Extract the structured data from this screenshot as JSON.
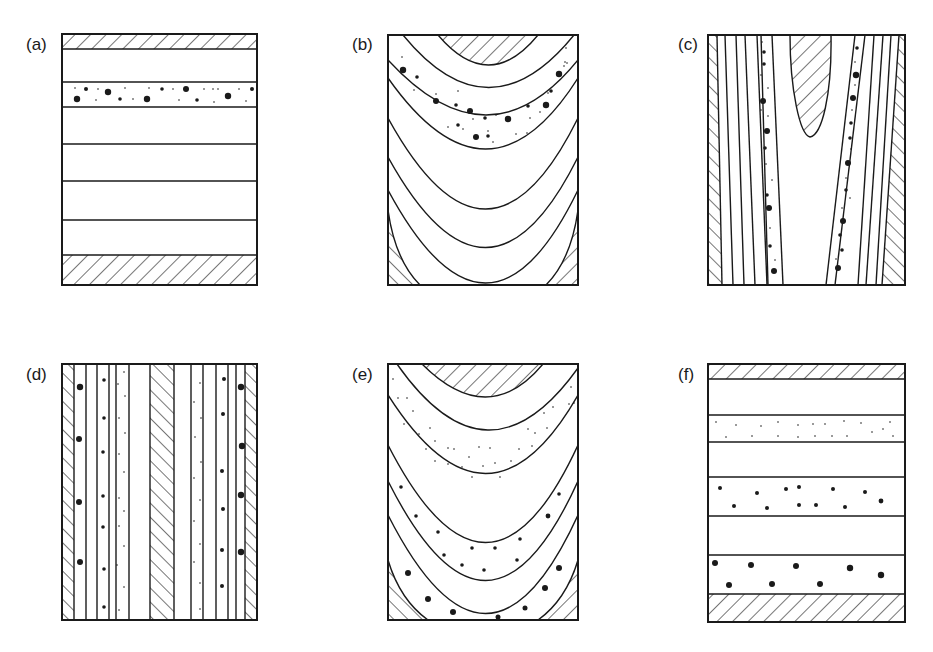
{
  "figure": {
    "ink_color": "#1a1a1a",
    "background_color": "#ffffff",
    "panels": [
      {
        "id": "a",
        "label": "(a)",
        "geometry": "horizontal layers",
        "hatched_units": [
          "top band",
          "bottom band"
        ],
        "layer_count": 6,
        "dotted_layers": [
          "second layer: mixed large and small dots"
        ]
      },
      {
        "id": "b",
        "label": "(b)",
        "geometry": "concave-up curved layers (synform)",
        "hatched_units": [
          "top center lens",
          "bottom-left corner",
          "bottom-right corner"
        ],
        "dotted_layers": [
          "upper curved band: mixed large and small dots"
        ]
      },
      {
        "id": "c",
        "label": "(c)",
        "geometry": "steep sub-vertical layers",
        "hatched_units": [
          "left edge strip",
          "right edge strip",
          "central top lens"
        ],
        "dotted_layers": [
          "left dotted strip",
          "right dotted strip"
        ]
      },
      {
        "id": "d",
        "label": "(d)",
        "geometry": "vertical layers",
        "hatched_units": [
          "left edge strip",
          "central strip",
          "right edge strip"
        ],
        "dotted_layers": [
          "large dots next to edge strips",
          "medium dots",
          "small dots next to central strip"
        ]
      },
      {
        "id": "e",
        "label": "(e)",
        "geometry": "concave-up curved layers (synform)",
        "hatched_units": [
          "top center lens",
          "bottom-left corner",
          "bottom-right corner"
        ],
        "dotted_layers": [
          "fine dots in upper band",
          "medium dots in middle band",
          "large dots in lowest band"
        ]
      },
      {
        "id": "f",
        "label": "(f)",
        "geometry": "horizontal layers",
        "hatched_units": [
          "top band",
          "bottom band"
        ],
        "dotted_layers": [
          "fine dots (upper)",
          "medium dots (middle)",
          "large dots (lower)"
        ]
      }
    ]
  }
}
